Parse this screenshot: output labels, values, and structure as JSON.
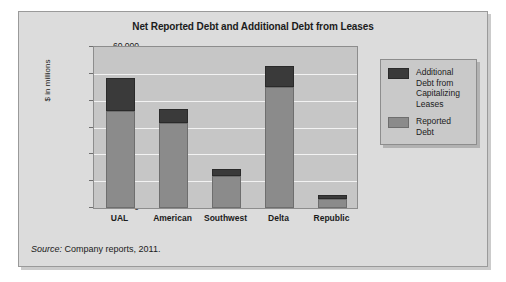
{
  "chart_data": {
    "type": "bar",
    "subtype": "stacked-bar",
    "title": "Net Reported Debt and Additional Debt from Leases",
    "xlabel": "",
    "ylabel": "$ in millions",
    "ylim": [
      0,
      60000
    ],
    "ytick_labels": [
      "60,000",
      "50,000",
      "40,000",
      "30,000",
      "20,000",
      "10,000",
      "0"
    ],
    "ytick_values": [
      60000,
      50000,
      40000,
      30000,
      20000,
      10000,
      0
    ],
    "grid": true,
    "legend_position": "right",
    "categories": [
      "UAL",
      "American",
      "Southwest",
      "Delta",
      "Republic"
    ],
    "series": [
      {
        "name": "Reported Debt",
        "color": "#8b8b8b",
        "values": [
          36000,
          31500,
          12000,
          45000,
          3500
        ]
      },
      {
        "name": "Additional Debt from Capitalizing Leases",
        "color": "#3a3a3a",
        "values": [
          12500,
          5500,
          2500,
          8000,
          1500
        ]
      }
    ],
    "totals": [
      48500,
      37000,
      14500,
      53000,
      5000
    ]
  },
  "chart": {
    "title": "Net Reported Debt and Additional Debt from Leases",
    "y_axis_title": "$ in millions",
    "y_ticks": [
      "60,000",
      "50,000",
      "40,000",
      "30,000",
      "20,000",
      "10,000",
      "0"
    ],
    "categories": [
      "UAL",
      "American",
      "Southwest",
      "Delta",
      "Republic"
    ],
    "legend": [
      {
        "label": "Additional Debt from Capitalizing Leases",
        "color": "#3a3a3a"
      },
      {
        "label": "Reported Debt",
        "color": "#8b8b8b"
      }
    ]
  },
  "source": {
    "lead": "Source:",
    "text": " Company reports, 2011."
  },
  "colors": {
    "panel_background": "#dcdcdc",
    "plot_background": "#c6c6c6",
    "gridline": "#f2f2f2",
    "reported_debt": "#8b8b8b",
    "additional_debt": "#3a3a3a",
    "text": "#1b1b1b"
  }
}
